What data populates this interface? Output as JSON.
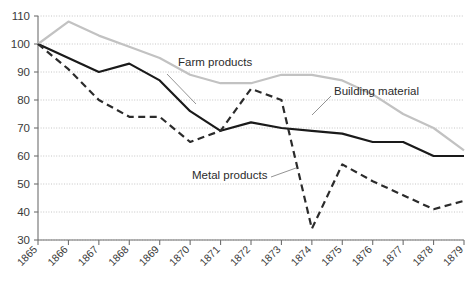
{
  "chart_data": {
    "type": "line",
    "title": "",
    "subtitle": "",
    "xlabel": "",
    "ylabel": "",
    "x": [
      1865,
      1866,
      1867,
      1868,
      1869,
      1870,
      1871,
      1872,
      1873,
      1874,
      1875,
      1876,
      1877,
      1878,
      1879
    ],
    "categories": [
      "1865",
      "1866",
      "1867",
      "1868",
      "1869",
      "1870",
      "1871",
      "1872",
      "1873",
      "1874",
      "1875",
      "1876",
      "1877",
      "1878",
      "1879"
    ],
    "xlim": [
      1865,
      1879
    ],
    "ylim": [
      30,
      110
    ],
    "ytick_values": [
      30,
      40,
      50,
      60,
      70,
      80,
      90,
      100,
      110
    ],
    "ytick_labels": [
      "30",
      "40",
      "50",
      "60",
      "70",
      "80",
      "90",
      "100",
      "110"
    ],
    "grid": true,
    "grid_style": "dotted-horizontal",
    "legend": "inline-annotations",
    "series": [
      {
        "name": "Farm products",
        "style": "solid",
        "color": "#1a1a1a",
        "width": 2.2,
        "values": [
          100,
          95,
          90,
          93,
          87,
          76,
          69,
          72,
          70,
          69,
          68,
          65,
          65,
          60,
          60
        ]
      },
      {
        "name": "Building material",
        "style": "solid",
        "color": "#c2c2c2",
        "width": 2.2,
        "values": [
          100,
          108,
          103,
          99,
          95,
          89,
          86,
          86,
          89,
          89,
          87,
          82,
          75,
          70,
          62
        ]
      },
      {
        "name": "Metal products",
        "style": "dashed",
        "color": "#2b2b2b",
        "width": 2.2,
        "values": [
          100,
          91,
          80,
          74,
          74,
          65,
          69,
          84,
          80,
          34,
          57,
          51,
          46,
          41,
          44
        ]
      }
    ],
    "annotations": [
      {
        "text": "Farm products",
        "series": "Farm products",
        "x_px": 178,
        "y_px": 66
      },
      {
        "text": "Building material",
        "series": "Building material",
        "x_px": 334,
        "y_px": 95
      },
      {
        "text": "Metal products",
        "series": "Metal products",
        "x_px": 192,
        "y_px": 179
      }
    ]
  }
}
